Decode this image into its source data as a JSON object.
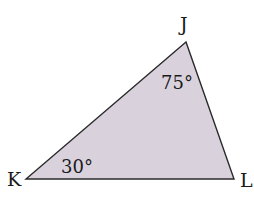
{
  "diagram": {
    "type": "triangle",
    "fill_color": "#d9d2dd",
    "stroke_color": "#2a2a2a",
    "vertices": [
      {
        "name": "J",
        "x": 186,
        "y": 42
      },
      {
        "name": "K",
        "x": 26,
        "y": 179
      },
      {
        "name": "L",
        "x": 234,
        "y": 179
      }
    ],
    "labels": {
      "J": "J",
      "K": "K",
      "L": "L"
    },
    "angles": {
      "J": "75°",
      "K": "30°"
    }
  }
}
